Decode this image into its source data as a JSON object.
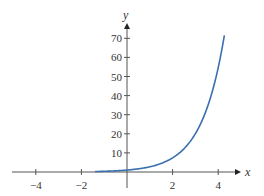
{
  "chart_data": {
    "type": "line",
    "title": "",
    "xlabel": "x",
    "ylabel": "y",
    "xlim": [
      -5,
      4.6
    ],
    "ylim": [
      0,
      77
    ],
    "grid": false,
    "legend": null,
    "x_ticks": [
      -4,
      -2,
      2,
      4
    ],
    "y_ticks": [
      10,
      20,
      30,
      40,
      50,
      60,
      70
    ],
    "series": [
      {
        "name": "y = e^x",
        "color": "#3a6fb0",
        "x": [
          -1.4,
          -1,
          0,
          1,
          2,
          2.5,
          3,
          3.5,
          4,
          4.27
        ],
        "y": [
          0.25,
          0.37,
          1,
          2.72,
          7.39,
          12.18,
          20.09,
          33.12,
          54.6,
          71.5
        ]
      }
    ]
  },
  "colors": {
    "axis": "#555555",
    "curve": "#3a6fb0"
  }
}
